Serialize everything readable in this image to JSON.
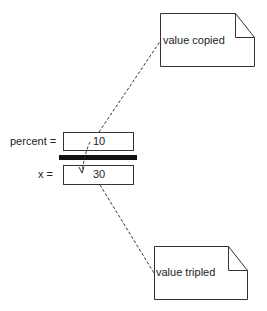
{
  "diagram": {
    "notes": [
      {
        "id": "top",
        "text": "value copied"
      },
      {
        "id": "bottom",
        "text": "value tripled"
      }
    ],
    "variables": [
      {
        "label": "percent =",
        "value": "10"
      },
      {
        "label": "x =",
        "value": "30"
      }
    ]
  }
}
